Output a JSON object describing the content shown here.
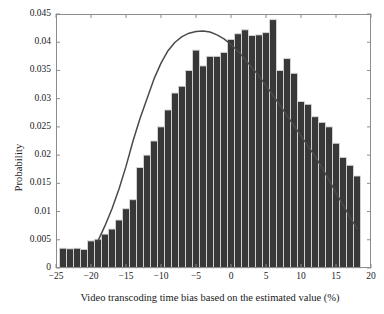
{
  "chart_data": {
    "type": "bar",
    "title": "",
    "subtitle": "",
    "xlabel": "Video transcoding time bias based on the estimated value (%)",
    "ylabel": "Probability",
    "xlim": [
      -25,
      20
    ],
    "ylim": [
      0,
      0.045
    ],
    "grid": false,
    "legend": null,
    "xticks": [
      -25,
      -20,
      -15,
      -10,
      -5,
      0,
      5,
      10,
      15,
      20
    ],
    "xtick_labels": [
      "−25",
      "−20",
      "−15",
      "−10",
      "−5",
      "0",
      "5",
      "10",
      "15",
      "20"
    ],
    "yticks": [
      0,
      0.005,
      0.01,
      0.015,
      0.02,
      0.025,
      0.03,
      0.035,
      0.04,
      0.045
    ],
    "ytick_labels": [
      "0",
      "0.005",
      "0.01",
      "0.015",
      "0.02",
      "0.025",
      "0.03",
      "0.035",
      "0.04",
      "0.045"
    ],
    "bar_width": 1,
    "bar_color": "#383838",
    "bar_edge_color": "#d8d8d8",
    "curve_color": "#4a4a4a",
    "axis_color": "#8c8c8c",
    "categories": [
      -24,
      -23,
      -22,
      -21,
      -20,
      -19,
      -18,
      -17,
      -16,
      -15,
      -14,
      -13,
      -12,
      -11,
      -10,
      -9,
      -8,
      -7,
      -6,
      -5,
      -4,
      -3,
      -2,
      -1,
      0,
      1,
      2,
      3,
      4,
      5,
      6,
      7,
      8,
      9,
      10,
      11,
      12,
      13,
      14,
      15,
      16,
      17,
      18
    ],
    "values": [
      0.0035,
      0.0034,
      0.0035,
      0.0033,
      0.0048,
      0.0051,
      0.006,
      0.0069,
      0.0085,
      0.0105,
      0.0121,
      0.0178,
      0.02,
      0.0225,
      0.025,
      0.028,
      0.031,
      0.0322,
      0.035,
      0.0386,
      0.0358,
      0.0375,
      0.0375,
      0.0382,
      0.0405,
      0.0415,
      0.0422,
      0.0412,
      0.0413,
      0.0417,
      0.044,
      0.035,
      0.0371,
      0.0345,
      0.0295,
      0.029,
      0.0268,
      0.0258,
      0.025,
      0.0221,
      0.0196,
      0.0182,
      0.0163
    ],
    "series": [
      {
        "name": "histogram",
        "values": [
          0.0035,
          0.0034,
          0.0035,
          0.0033,
          0.0048,
          0.0051,
          0.006,
          0.0069,
          0.0085,
          0.0105,
          0.0121,
          0.0178,
          0.02,
          0.0225,
          0.025,
          0.028,
          0.031,
          0.0322,
          0.035,
          0.0386,
          0.0358,
          0.0375,
          0.0375,
          0.0382,
          0.0405,
          0.0415,
          0.0422,
          0.0412,
          0.0413,
          0.0417,
          0.044,
          0.035,
          0.0371,
          0.0345,
          0.0295,
          0.029,
          0.0268,
          0.0258,
          0.025,
          0.0221,
          0.0196,
          0.0182,
          0.0163
        ]
      },
      {
        "name": "fitted-curve",
        "x": [
          -19,
          -18,
          -17,
          -16,
          -15,
          -14,
          -13,
          -12,
          -11,
          -10,
          -9,
          -8,
          -7,
          -6,
          -5,
          -4,
          -3,
          -2,
          -1,
          0,
          1,
          2,
          3,
          4,
          5,
          6,
          7,
          8,
          9,
          10,
          11,
          12,
          13,
          14,
          15,
          16,
          17,
          18
        ],
        "values": [
          0.0048,
          0.0075,
          0.0105,
          0.014,
          0.018,
          0.0225,
          0.0265,
          0.03,
          0.0335,
          0.0363,
          0.0385,
          0.04,
          0.041,
          0.0416,
          0.0419,
          0.042,
          0.0418,
          0.0413,
          0.0406,
          0.0396,
          0.0384,
          0.037,
          0.0355,
          0.034,
          0.0323,
          0.0306,
          0.0288,
          0.027,
          0.0252,
          0.0234,
          0.0216,
          0.0198,
          0.0178,
          0.0156,
          0.0133,
          0.0112,
          0.009,
          0.007
        ]
      }
    ]
  },
  "axes": {
    "xlabel": "Video transcoding time bias based on the estimated value (%)",
    "ylabel": "Probability"
  }
}
